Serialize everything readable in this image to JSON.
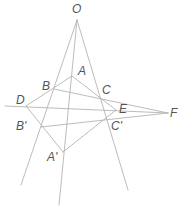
{
  "diagram": {
    "colors": {
      "line": "#b4b4b4",
      "label": "#555555",
      "background": "#ffffff"
    },
    "points": {
      "O": {
        "label": "O",
        "x": 77,
        "y": 20
      },
      "A": {
        "label": "A",
        "x": 72,
        "y": 76
      },
      "B": {
        "label": "B",
        "x": 54,
        "y": 89
      },
      "C": {
        "label": "C",
        "x": 100,
        "y": 98
      },
      "D": {
        "label": "D",
        "x": 26,
        "y": 106
      },
      "E": {
        "label": "E",
        "x": 116,
        "y": 110
      },
      "F": {
        "label": "F",
        "x": 168,
        "y": 113
      },
      "B_prime": {
        "label": "B'",
        "x": 41,
        "y": 127
      },
      "C_prime": {
        "label": "C'",
        "x": 107,
        "y": 118
      },
      "A_prime": {
        "label": "A'",
        "x": 63,
        "y": 152
      }
    },
    "labels": {
      "O": "O",
      "A": "A",
      "B": "B",
      "C": "C",
      "D": "D",
      "E": "E",
      "F": "F",
      "B_prime": "B'",
      "C_prime": "C'",
      "A_prime": "A'"
    },
    "segments": [
      {
        "name": "ray-O-B-B'",
        "from": "O",
        "to": "end_left"
      },
      {
        "name": "ray-O-A-A'",
        "from": "O",
        "to": "end_mid"
      },
      {
        "name": "ray-O-C-C'",
        "from": "O",
        "to": "end_right"
      },
      {
        "name": "triangle-ABC-side-AB",
        "from": "A",
        "to": "B"
      },
      {
        "name": "triangle-ABC-side-AC",
        "from": "A",
        "to": "C"
      },
      {
        "name": "triangle-ABC-side-BC",
        "from": "B",
        "to": "C"
      },
      {
        "name": "triangle-A'B'C'-side-A'B'",
        "from": "A'",
        "to": "B'"
      },
      {
        "name": "triangle-A'B'C'-side-A'C'",
        "from": "A'",
        "to": "C'"
      },
      {
        "name": "triangle-A'B'C'-side-B'C'",
        "from": "B'",
        "to": "C'"
      },
      {
        "name": "line-D-F",
        "from": "D",
        "to": "F"
      }
    ]
  }
}
